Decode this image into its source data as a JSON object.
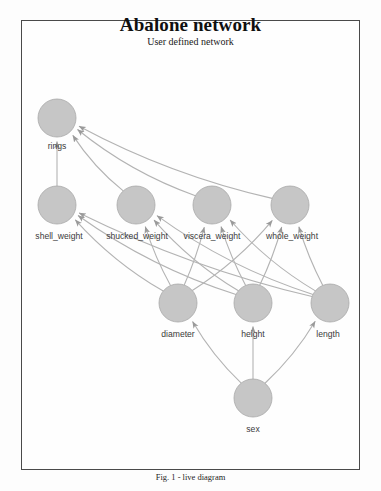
{
  "header": {
    "title": "Abalone network",
    "subtitle": "User defined network"
  },
  "caption": "Fig. 1 - live diagram",
  "colors": {
    "node_fill": "#c6c6c6",
    "node_stroke": "#a8a8a8",
    "edge": "#b3b3b3",
    "frame": "#4a4a4a",
    "background": "#fefefe",
    "label_text": "#3a3a3a",
    "title_text": "#101010"
  },
  "chart_data": {
    "type": "diagram",
    "diagram_type": "directed-acyclic-graph",
    "title": "Abalone network",
    "subtitle": "User defined network",
    "caption": "Fig. 1 - live diagram",
    "node_radius": 19,
    "nodes": [
      {
        "id": "rings",
        "label": "rings",
        "x": 36,
        "y": 98,
        "label_x": 36,
        "label_y": 129
      },
      {
        "id": "shell_weight",
        "label": "shell_weight",
        "x": 36,
        "y": 185,
        "label_x": 38,
        "label_y": 219
      },
      {
        "id": "shucked_weight",
        "label": "shucked_weight",
        "x": 115,
        "y": 185,
        "label_x": 116,
        "label_y": 219
      },
      {
        "id": "viscera_weight",
        "label": "viscera_weight",
        "x": 191,
        "y": 185,
        "label_x": 191,
        "label_y": 219
      },
      {
        "id": "whole_weight",
        "label": "whole_weight",
        "x": 269,
        "y": 185,
        "label_x": 271,
        "label_y": 219
      },
      {
        "id": "diameter",
        "label": "diameter",
        "x": 157,
        "y": 283,
        "label_x": 157,
        "label_y": 317
      },
      {
        "id": "height",
        "label": "height",
        "x": 232,
        "y": 283,
        "label_x": 232,
        "label_y": 317
      },
      {
        "id": "length",
        "label": "length",
        "x": 309,
        "y": 283,
        "label_x": 307,
        "label_y": 317
      },
      {
        "id": "sex",
        "label": "sex",
        "x": 232,
        "y": 378,
        "label_x": 232,
        "label_y": 412
      }
    ],
    "edges": [
      {
        "from": "shell_weight",
        "to": "rings"
      },
      {
        "from": "shucked_weight",
        "to": "rings"
      },
      {
        "from": "viscera_weight",
        "to": "rings"
      },
      {
        "from": "whole_weight",
        "to": "rings"
      },
      {
        "from": "diameter",
        "to": "shell_weight"
      },
      {
        "from": "diameter",
        "to": "shucked_weight"
      },
      {
        "from": "diameter",
        "to": "viscera_weight"
      },
      {
        "from": "diameter",
        "to": "whole_weight"
      },
      {
        "from": "height",
        "to": "shell_weight"
      },
      {
        "from": "height",
        "to": "shucked_weight"
      },
      {
        "from": "height",
        "to": "viscera_weight"
      },
      {
        "from": "height",
        "to": "whole_weight"
      },
      {
        "from": "length",
        "to": "shell_weight"
      },
      {
        "from": "length",
        "to": "shucked_weight"
      },
      {
        "from": "length",
        "to": "viscera_weight"
      },
      {
        "from": "length",
        "to": "whole_weight"
      },
      {
        "from": "sex",
        "to": "diameter"
      },
      {
        "from": "sex",
        "to": "height"
      },
      {
        "from": "sex",
        "to": "length"
      }
    ]
  }
}
